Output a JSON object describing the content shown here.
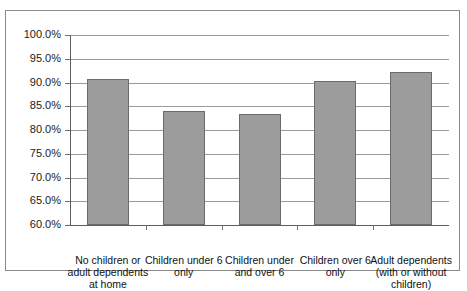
{
  "chart_data": {
    "type": "bar",
    "title": "",
    "xlabel": "",
    "ylabel": "",
    "categories": [
      "No children or adult dependents at home",
      "Children under 6 only",
      "Children under and over 6",
      "Children over 6 only",
      "Adult dependents (with or without children)"
    ],
    "values": [
      90.7,
      84.1,
      83.3,
      90.4,
      92.3
    ],
    "ylim": [
      60.0,
      100.0
    ],
    "ytick_step": 5.0,
    "ytick_labels": [
      "100.0%",
      "95.0%",
      "90.0%",
      "85.0%",
      "80.0%",
      "75.0%",
      "70.0%",
      "65.0%",
      "60.0%"
    ],
    "ytick_values": [
      100.0,
      95.0,
      90.0,
      85.0,
      80.0,
      75.0,
      70.0,
      65.0,
      60.0
    ],
    "grid": true,
    "legend": false,
    "value_format": "percent",
    "colors": {
      "bar_fill": "#9c9c9c",
      "bar_border": "#6b6b6b",
      "gridline": "#9a9a9a",
      "axis": "#5e5e5e",
      "frame": "#8a8a8a",
      "text": "#111111",
      "background": "#ffffff"
    }
  }
}
